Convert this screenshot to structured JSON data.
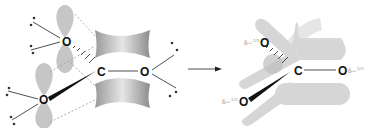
{
  "diagram": {
    "left_panel": {
      "atoms": [
        {
          "id": "o_top",
          "label": "O"
        },
        {
          "id": "c_center",
          "label": "C"
        },
        {
          "id": "o_right",
          "label": "O"
        },
        {
          "id": "o_bottom",
          "label": "O"
        }
      ],
      "features": [
        "p-orbital lobes on oxygen atoms",
        "pi-bond electron cloud between C and O",
        "lone pair dots on oxygen atoms",
        "dashed overlap lines",
        "wedge and hash bonds"
      ]
    },
    "arrow": {
      "direction": "right"
    },
    "right_panel": {
      "atoms": [
        {
          "id": "o_top",
          "label": "O",
          "charge": "δ−",
          "fraction": "2/3"
        },
        {
          "id": "c_center",
          "label": "C"
        },
        {
          "id": "o_right",
          "label": "O",
          "charge": "δ−",
          "fraction": "2/3"
        },
        {
          "id": "o_bottom",
          "label": "O",
          "charge": "δ−",
          "fraction": "2/3"
        }
      ],
      "features": [
        "delocalized pi-system shown as translucent grey bands"
      ]
    },
    "colors": {
      "lobe": "#c8c8c8",
      "band": "#d4d4d4",
      "text": "#111111",
      "label": "#8a8a8a"
    }
  }
}
